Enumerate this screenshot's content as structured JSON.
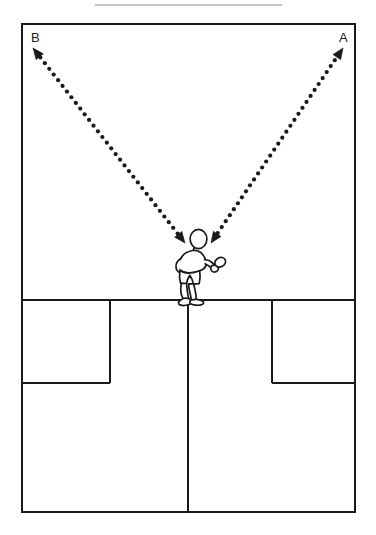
{
  "figure": {
    "kind": "badminton-court-movement-diagram",
    "background_color": "#ffffff",
    "line_color": "#1a1a1a",
    "rule_color": "#b0b0b0",
    "width": 376,
    "height": 535
  },
  "top_rule": {
    "name": "top-divider",
    "x1": 95,
    "x2": 282,
    "y": 5,
    "color": "#b0b0b0"
  },
  "court": {
    "name": "badminton-court",
    "outer": {
      "x": 22,
      "y": 24,
      "width": 333,
      "height": 488
    },
    "service_line_y": 300,
    "center_line_x": 188,
    "center_line_from_y": 300,
    "center_line_to_y": 512,
    "left_service_box": {
      "x": 22,
      "y": 300,
      "width": 88,
      "height": 83
    },
    "right_service_box": {
      "x": 272,
      "y": 300,
      "width": 83,
      "height": 83
    },
    "stroke_width": 2
  },
  "labels": [
    {
      "id": "label-b",
      "text": "B",
      "x": 31,
      "y": 42
    },
    {
      "id": "label-a",
      "text": "A",
      "x": 339,
      "y": 42
    }
  ],
  "arrows": [
    {
      "id": "arrow-to-b",
      "label": "B",
      "direction": "bidirectional",
      "from": {
        "x": 185,
        "y": 243
      },
      "to": {
        "x": 33,
        "y": 48
      },
      "style": "dotted",
      "dot_radius": 2.1,
      "color": "#1a1a1a"
    },
    {
      "id": "arrow-to-a",
      "label": "A",
      "direction": "bidirectional",
      "from": {
        "x": 211,
        "y": 243
      },
      "to": {
        "x": 343,
        "y": 48
      },
      "style": "dotted",
      "dot_radius": 2.1,
      "color": "#1a1a1a"
    }
  ],
  "player": {
    "name": "player-figure",
    "description": "player holding racket, viewed from behind, standing at center service line",
    "x": 170,
    "y": 228,
    "width": 60,
    "height": 75,
    "stroke_color": "#1a1a1a",
    "fill_color": "#ffffff"
  }
}
